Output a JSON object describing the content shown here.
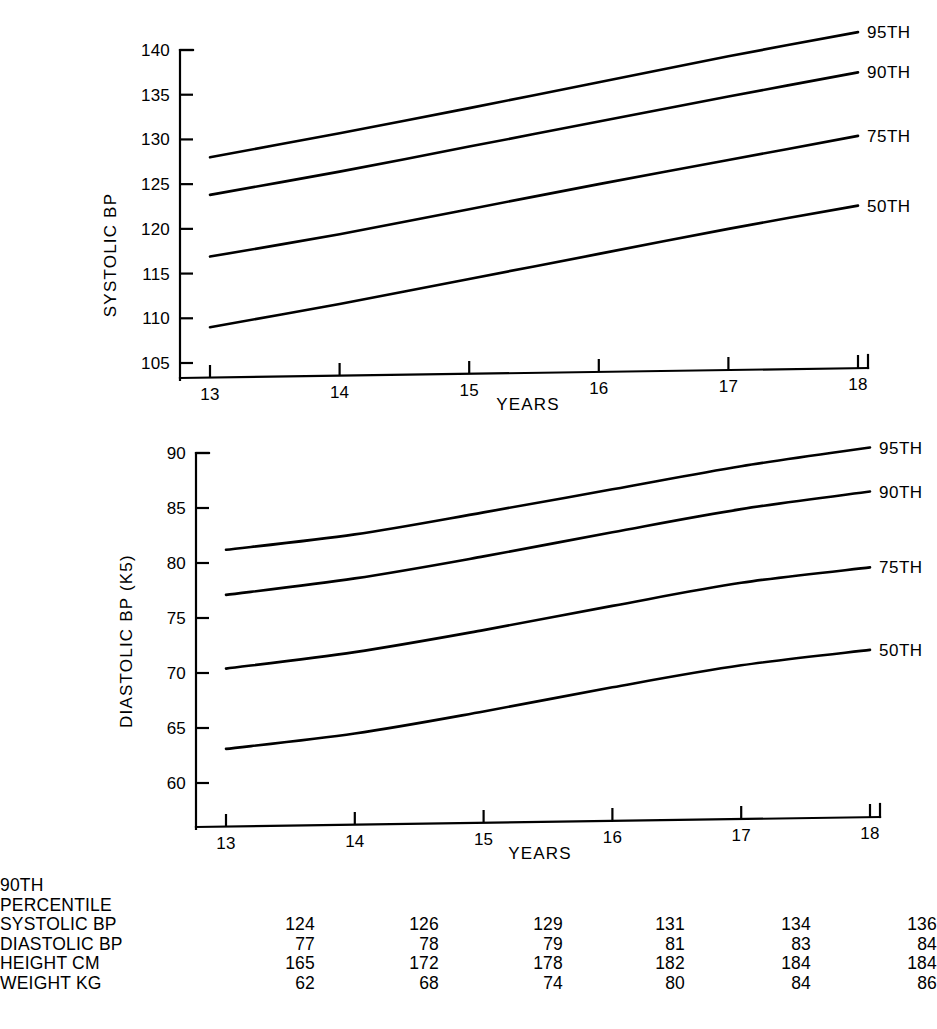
{
  "figure": {
    "background": "#ffffff",
    "ink_color": "#000000"
  },
  "chart_data": [
    {
      "type": "line",
      "id": "systolic",
      "title": "",
      "xlabel": "YEARS",
      "ylabel": "SYSTOLIC BP",
      "x": [
        13,
        14,
        15,
        16,
        17,
        18
      ],
      "xticklabels": [
        "13",
        "14",
        "15",
        "16",
        "17",
        "18"
      ],
      "xlim": [
        13,
        18
      ],
      "ylim": [
        103.5,
        142.5
      ],
      "yticks": [
        105,
        110,
        115,
        120,
        125,
        130,
        135,
        140
      ],
      "yticklabels": [
        "105",
        "110",
        "115",
        "120",
        "125",
        "130",
        "135",
        "140"
      ],
      "grid": false,
      "legend_position": "right-end-labels",
      "series": [
        {
          "name": "95TH",
          "label": "95TH",
          "values": [
            128.0,
            130.7,
            133.5,
            136.4,
            139.3,
            142.0
          ]
        },
        {
          "name": "90TH",
          "label": "90TH",
          "values": [
            123.8,
            126.4,
            129.2,
            132.0,
            134.8,
            137.5
          ]
        },
        {
          "name": "75TH",
          "label": "75TH",
          "values": [
            116.9,
            119.4,
            122.2,
            125.0,
            127.7,
            130.4
          ]
        },
        {
          "name": "50TH",
          "label": "50TH",
          "values": [
            109.0,
            111.6,
            114.4,
            117.2,
            120.0,
            122.6
          ]
        }
      ]
    },
    {
      "type": "line",
      "id": "diastolic",
      "title": "",
      "xlabel": "YEARS",
      "ylabel": "DIASTOLIC BP (K5)",
      "x": [
        13,
        14,
        15,
        16,
        17,
        18
      ],
      "xticklabels": [
        "13",
        "14",
        "15",
        "16",
        "17",
        "18"
      ],
      "xlim": [
        13,
        18
      ],
      "ylim": [
        58.5,
        91.5
      ],
      "yticks": [
        60,
        65,
        70,
        75,
        80,
        85,
        90
      ],
      "yticklabels": [
        "60",
        "65",
        "70",
        "75",
        "80",
        "85",
        "90"
      ],
      "grid": false,
      "legend_position": "right-end-labels",
      "series": [
        {
          "name": "95TH",
          "label": "95TH",
          "values": [
            81.2,
            82.6,
            84.6,
            86.7,
            88.8,
            90.5
          ]
        },
        {
          "name": "90TH",
          "label": "90TH",
          "values": [
            77.1,
            78.6,
            80.6,
            82.8,
            84.9,
            86.5
          ]
        },
        {
          "name": "75TH",
          "label": "75TH",
          "values": [
            70.4,
            71.9,
            73.9,
            76.1,
            78.2,
            79.6
          ]
        },
        {
          "name": "50TH",
          "label": "50TH",
          "values": [
            63.1,
            64.5,
            66.5,
            68.7,
            70.7,
            72.1
          ]
        }
      ]
    }
  ],
  "table": {
    "heading_line1": "90TH",
    "heading_line2": "PERCENTILE",
    "rows": [
      {
        "label": "SYSTOLIC BP",
        "values": [
          "124",
          "126",
          "129",
          "131",
          "134",
          "136"
        ]
      },
      {
        "label": "DIASTOLIC BP",
        "values": [
          "77",
          "78",
          "79",
          "81",
          "83",
          "84"
        ]
      },
      {
        "label": "HEIGHT CM",
        "values": [
          "165",
          "172",
          "178",
          "182",
          "184",
          "184"
        ]
      },
      {
        "label": "WEIGHT KG",
        "values": [
          "62",
          "68",
          "74",
          "80",
          "84",
          "86"
        ]
      }
    ]
  }
}
